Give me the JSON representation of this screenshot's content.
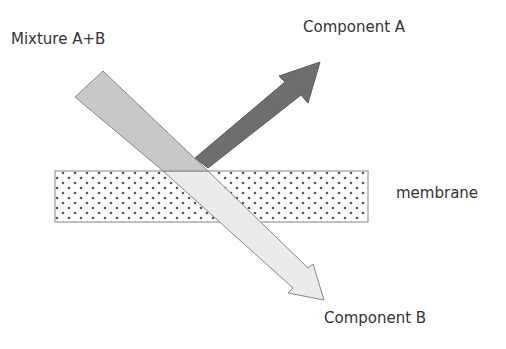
{
  "labels": {
    "mixture": "Mixture A+B",
    "component_a": "Component A",
    "component_b": "Component B",
    "membrane": "membrane"
  },
  "colors": {
    "mixture_fill": "#c8c8c8",
    "component_a_fill": "#6e6e6e",
    "component_b_fill": "#ebebeb",
    "membrane_dot": "#555555",
    "outline": "#808080",
    "text": "#333333"
  }
}
